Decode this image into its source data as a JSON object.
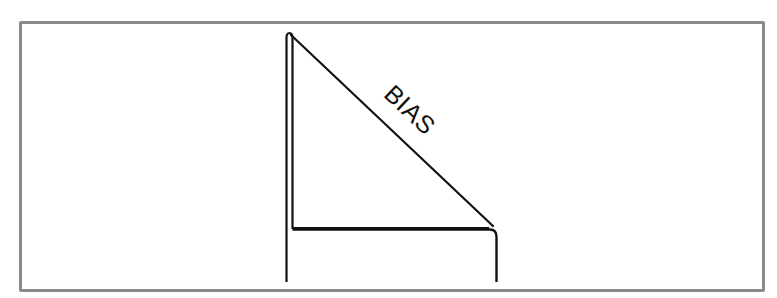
{
  "diagram": {
    "label": "BIAS",
    "colors": {
      "stroke": "#111111",
      "frame": "#8a8a8a",
      "background": "#ffffff"
    }
  }
}
